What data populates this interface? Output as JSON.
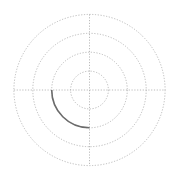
{
  "chart_data": {
    "type": "line",
    "subtype": "polar",
    "title": "",
    "xlabel": "",
    "ylabel": "",
    "grid": true,
    "legend": null,
    "tick_labels": [],
    "radial_rings": [
      1,
      2,
      3,
      4
    ],
    "angular_axes_deg": [
      0,
      90,
      180,
      270
    ],
    "rlim": [
      0,
      4
    ],
    "series": [
      {
        "name": "arc",
        "r": [
          2,
          2,
          2,
          2,
          2
        ],
        "theta_deg": [
          180,
          202.5,
          225,
          247.5,
          270
        ]
      }
    ],
    "colors": {
      "grid": "#aaaaaa",
      "series": "#6b6b6b",
      "background": "#ffffff"
    }
  },
  "geometry": {
    "cx": 89.5,
    "cy": 90,
    "ring_px": 18.9
  }
}
